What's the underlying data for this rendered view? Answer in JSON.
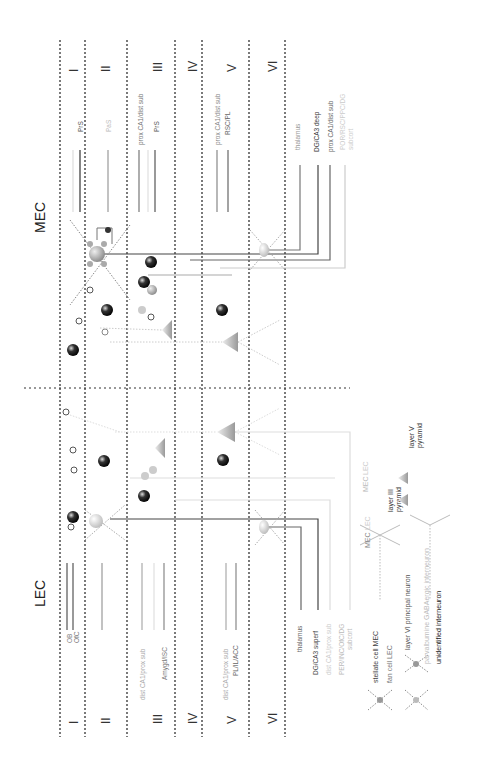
{
  "regions": {
    "mec": {
      "title": "MEC"
    },
    "lec": {
      "title": "LEC"
    }
  },
  "layers": [
    "I",
    "II",
    "III",
    "IV",
    "V",
    "VI"
  ],
  "mec_labels": {
    "layer1": [
      {
        "text": "PrS",
        "color": "#555555"
      },
      {
        "text": "",
        "color": "#dddddd"
      }
    ],
    "layer2": [
      {
        "text": "PaS",
        "color": "#bbbbbb"
      }
    ],
    "layer3": [
      {
        "text": "prox CA1/dist sub",
        "color": "#777777"
      },
      {
        "text": "",
        "color": "#e0e0e0"
      },
      {
        "text": "PrS",
        "color": "#555555"
      }
    ],
    "layer5": [
      {
        "text": "prox CA1/dist sub",
        "color": "#888888"
      },
      {
        "text": "RSC/PL",
        "color": "#666666"
      }
    ],
    "layer6": [
      {
        "text": "thalamus",
        "color": "#999999"
      },
      {
        "text": "DG/CA3 deep",
        "color": "#333333"
      },
      {
        "text": "prox CA1/dist sub",
        "color": "#666666"
      },
      {
        "text": "POR/RSC/PPC/DG",
        "color": "#cccccc"
      },
      {
        "text": "subcort",
        "color": "#cccccc"
      }
    ]
  },
  "lec_labels": {
    "layer1": [
      {
        "text": "OB",
        "color": "#888888"
      },
      {
        "text": "OfC",
        "color": "#777777"
      },
      {
        "text": "",
        "color": "#e0e0e0"
      }
    ],
    "layer3": [
      {
        "text": "dist CA1/prox sub",
        "color": "#aaaaaa"
      },
      {
        "text": "",
        "color": "#e0e0e0"
      },
      {
        "text": "Amygd/ISC",
        "color": "#777777"
      }
    ],
    "layer5": [
      {
        "text": "dist CA1/prox sub",
        "color": "#aaaaaa"
      },
      {
        "text": "PL/IL/ACC",
        "color": "#666666"
      }
    ],
    "layer6": [
      {
        "text": "thalamus",
        "color": "#666666"
      },
      {
        "text": "DG/CA3 superf",
        "color": "#444444"
      },
      {
        "text": "dist CA1/prox sub",
        "color": "#cccccc"
      },
      {
        "text": "PER/INC/OfC/DG",
        "color": "#bbbbbb"
      },
      {
        "text": "subcort",
        "color": "#bbbbbb"
      }
    ]
  },
  "legend": {
    "items": [
      {
        "label": "stellate cell MEC",
        "color": "#444444"
      },
      {
        "label": "fan cell LEC",
        "color": "#777777"
      },
      {
        "label": "layer VI principal neuron",
        "color": "#555555"
      },
      {
        "label": "parvalbumine GABAergic interneuron",
        "color": "#bbbbbb"
      },
      {
        "label": "unidentified interneuron",
        "color": "#222222"
      }
    ],
    "pyramids": {
      "l3": {
        "label1": "layer III",
        "label2": "pyramid",
        "mec": "MEC",
        "lec": "LEC"
      },
      "l5": {
        "label1": "layer V",
        "label2": "pyramid",
        "mec": "MEC",
        "lec": "LEC"
      }
    }
  },
  "colors": {
    "dashed": "#222222",
    "dark": "#333333",
    "mid": "#888888",
    "light": "#cccccc"
  }
}
